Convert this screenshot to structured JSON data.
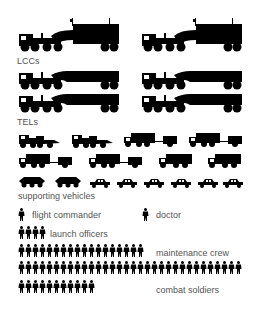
{
  "diagram": {
    "colors": {
      "icon": "#000000",
      "label": "#555555",
      "background": "#ffffff"
    },
    "groups": [
      {
        "id": "lccs",
        "label": "LCCs",
        "icon": "command-truck-icon",
        "count": 2
      },
      {
        "id": "tels",
        "label": "TELs",
        "icon": "launcher-truck-icon",
        "count": 4
      },
      {
        "id": "supporting",
        "label": "supporting vehicles",
        "icons": {
          "cargo_truck": 2,
          "truck_with_trailer": 4,
          "truck": 2,
          "apc": 2,
          "car": 6
        }
      },
      {
        "id": "flight_commander",
        "label": "flight commander",
        "icon": "person-icon",
        "count": 1
      },
      {
        "id": "doctor",
        "label": "doctor",
        "icon": "person-icon",
        "count": 1
      },
      {
        "id": "launch_officers",
        "label": "launch officers",
        "icon": "person-icon",
        "count": 4
      },
      {
        "id": "maintenance_crew",
        "label": "maintenance crew",
        "icon": "person-icon",
        "count": 50
      },
      {
        "id": "combat_soldiers",
        "label": "combat soldiers",
        "icon": "person-icon",
        "count": 11
      }
    ]
  },
  "labels": {
    "lccs": "LCCs",
    "tels": "TELs",
    "supporting": "supporting vehicles",
    "flight_commander": "flight commander",
    "doctor": "doctor",
    "launch_officers": "launch officers",
    "maintenance_crew": "maintenance crew",
    "combat_soldiers": "combat soldiers"
  }
}
